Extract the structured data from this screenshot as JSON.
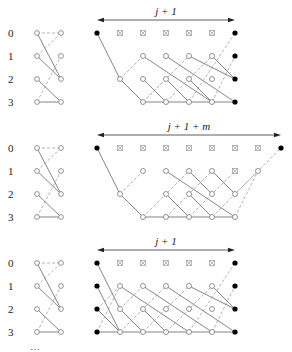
{
  "panels": [
    {
      "name": "panel-top",
      "row_labels": [
        "0",
        "1",
        "2",
        "3"
      ],
      "span_label": "j + 1",
      "y0": 33,
      "arrow": {
        "x1": 97,
        "x2": 235,
        "y": 20
      },
      "title_x": 166,
      "filled_nodes": [
        [
          97,
          0
        ],
        [
          235,
          0
        ],
        [
          235,
          1
        ],
        [
          235,
          2
        ],
        [
          235,
          3
        ]
      ],
      "crosses": [
        [
          120,
          0
        ],
        [
          143,
          0
        ],
        [
          166,
          0
        ],
        [
          189,
          0
        ],
        [
          212,
          0
        ]
      ],
      "open_nodes": [
        [
          143,
          1
        ],
        [
          166,
          1
        ],
        [
          189,
          1
        ],
        [
          212,
          1
        ],
        [
          120,
          2
        ],
        [
          143,
          2
        ],
        [
          166,
          2
        ],
        [
          189,
          2
        ],
        [
          212,
          2
        ],
        [
          143,
          3
        ],
        [
          166,
          3
        ],
        [
          189,
          3
        ],
        [
          212,
          3
        ]
      ],
      "solid_edges": [
        [
          97,
          0,
          120,
          2
        ],
        [
          120,
          2,
          143,
          3
        ],
        [
          143,
          3,
          235,
          3
        ],
        [
          143,
          1,
          212,
          3
        ],
        [
          166,
          1,
          235,
          3
        ],
        [
          189,
          1,
          235,
          2
        ],
        [
          212,
          1,
          235,
          2
        ],
        [
          143,
          2,
          166,
          3
        ],
        [
          166,
          2,
          189,
          3
        ],
        [
          189,
          2,
          212,
          3
        ]
      ],
      "dashed_edges": [
        [
          120,
          2,
          143,
          1
        ],
        [
          143,
          3,
          189,
          1
        ],
        [
          166,
          3,
          212,
          1
        ],
        [
          189,
          3,
          235,
          0
        ],
        [
          212,
          3,
          235,
          1
        ],
        [
          166,
          2,
          143,
          3
        ]
      ]
    },
    {
      "name": "panel-middle",
      "row_labels": [
        "0",
        "1",
        "2",
        "3"
      ],
      "span_label": "j + 1 + m",
      "y0": 148,
      "arrow": {
        "x1": 97,
        "x2": 281,
        "y": 135
      },
      "title_x": 189,
      "filled_nodes": [
        [
          97,
          0
        ],
        [
          281,
          0
        ]
      ],
      "crosses": [
        [
          120,
          0
        ],
        [
          143,
          0
        ],
        [
          166,
          0
        ],
        [
          189,
          0
        ],
        [
          212,
          0
        ],
        [
          235,
          0
        ],
        [
          258,
          0
        ],
        [
          235,
          1
        ]
      ],
      "open_nodes": [
        [
          143,
          1
        ],
        [
          166,
          1
        ],
        [
          189,
          1
        ],
        [
          212,
          1
        ],
        [
          258,
          1
        ],
        [
          120,
          2
        ],
        [
          166,
          2
        ],
        [
          189,
          2
        ],
        [
          212,
          2
        ],
        [
          235,
          2
        ],
        [
          143,
          3
        ],
        [
          166,
          3
        ],
        [
          189,
          3
        ],
        [
          212,
          3
        ],
        [
          235,
          3
        ]
      ],
      "solid_edges": [
        [
          97,
          0,
          120,
          2
        ],
        [
          120,
          2,
          143,
          3
        ],
        [
          143,
          3,
          235,
          3
        ],
        [
          166,
          1,
          235,
          3
        ],
        [
          189,
          1,
          212,
          2
        ],
        [
          212,
          1,
          235,
          2
        ],
        [
          143,
          1,
          143,
          1
        ],
        [
          166,
          2,
          189,
          3
        ],
        [
          189,
          2,
          212,
          3
        ]
      ],
      "dashed_edges": [
        [
          120,
          2,
          143,
          1
        ],
        [
          143,
          3,
          189,
          1
        ],
        [
          166,
          3,
          212,
          1
        ],
        [
          189,
          3,
          235,
          1
        ],
        [
          212,
          3,
          258,
          1
        ],
        [
          235,
          2,
          281,
          0
        ],
        [
          235,
          3,
          258,
          1
        ]
      ]
    },
    {
      "name": "panel-bottom",
      "row_labels": [
        "0",
        "1",
        "2",
        "3"
      ],
      "span_label": "j + 1",
      "y0": 263,
      "arrow": {
        "x1": 97,
        "x2": 235,
        "y": 250
      },
      "title_x": 166,
      "filled_nodes": [
        [
          97,
          0
        ],
        [
          97,
          1
        ],
        [
          97,
          2
        ],
        [
          97,
          3
        ],
        [
          235,
          0
        ],
        [
          235,
          1
        ],
        [
          235,
          2
        ],
        [
          235,
          3
        ]
      ],
      "crosses": [
        [
          120,
          0
        ],
        [
          143,
          0
        ],
        [
          166,
          0
        ],
        [
          189,
          0
        ],
        [
          212,
          0
        ]
      ],
      "open_nodes": [
        [
          120,
          1
        ],
        [
          143,
          1
        ],
        [
          166,
          1
        ],
        [
          189,
          1
        ],
        [
          212,
          1
        ],
        [
          120,
          2
        ],
        [
          143,
          2
        ],
        [
          166,
          2
        ],
        [
          189,
          2
        ],
        [
          212,
          2
        ],
        [
          120,
          3
        ],
        [
          143,
          3
        ],
        [
          166,
          3
        ],
        [
          189,
          3
        ],
        [
          212,
          3
        ]
      ],
      "solid_edges": [
        [
          97,
          0,
          120,
          2
        ],
        [
          97,
          1,
          120,
          3
        ],
        [
          97,
          2,
          120,
          3
        ],
        [
          97,
          3,
          235,
          3
        ],
        [
          120,
          1,
          189,
          3
        ],
        [
          143,
          1,
          212,
          3
        ],
        [
          166,
          1,
          235,
          3
        ],
        [
          189,
          1,
          235,
          2
        ],
        [
          212,
          1,
          235,
          2
        ],
        [
          120,
          2,
          143,
          3
        ],
        [
          143,
          2,
          166,
          3
        ]
      ],
      "dashed_edges": [
        [
          97,
          3,
          120,
          1
        ],
        [
          97,
          2,
          120,
          1
        ],
        [
          120,
          3,
          166,
          1
        ],
        [
          143,
          3,
          189,
          1
        ],
        [
          166,
          3,
          212,
          1
        ],
        [
          189,
          3,
          235,
          0
        ],
        [
          212,
          3,
          235,
          1
        ],
        [
          120,
          2,
          143,
          1
        ]
      ]
    }
  ],
  "small_diagram": {
    "left_x": 37,
    "right_x": 61,
    "solid_edges": [
      [
        0,
        2
      ],
      [
        1,
        2
      ],
      [
        2,
        3
      ],
      [
        3,
        3
      ]
    ],
    "dashed_edges": [
      [
        0,
        0
      ],
      [
        1,
        0
      ],
      [
        3,
        1
      ]
    ]
  },
  "caption_partial": "…"
}
